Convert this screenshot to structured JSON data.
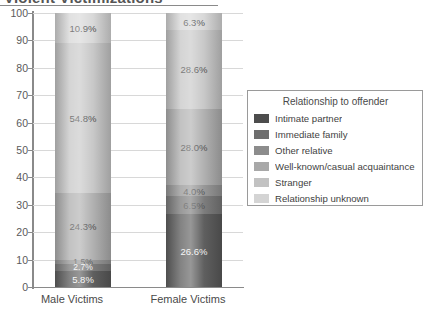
{
  "chart": {
    "title": "Violent Victimizations",
    "xlabel": "",
    "ylabel": ""
  },
  "axis": {
    "ticks": [
      "100",
      "90",
      "80",
      "70",
      "60",
      "50",
      "40",
      "30",
      "20",
      "10",
      "0"
    ]
  },
  "categories": {
    "male": "Male Victims",
    "female": "Female Victims"
  },
  "legend": {
    "title": "Relationship to offender",
    "items": [
      {
        "label": "Intimate partner",
        "color": "#4d4d4d"
      },
      {
        "label": "Immediate family",
        "color": "#6e6e6e"
      },
      {
        "label": "Other relative",
        "color": "#8c8c8c"
      },
      {
        "label": "Well-known/casual acquaintance",
        "color": "#a8a8a8"
      },
      {
        "label": "Stranger",
        "color": "#c2c2c2"
      },
      {
        "label": "Relationship unknown",
        "color": "#d4d4d4"
      }
    ]
  },
  "segments": {
    "male": [
      {
        "label": "10.9%",
        "value": 10.9,
        "series": "Relationship unknown",
        "color": "#d4d4d4",
        "light": false
      },
      {
        "label": "54.8%",
        "value": 54.8,
        "series": "Stranger",
        "color": "#c2c2c2",
        "light": false
      },
      {
        "label": "24.3%",
        "value": 24.3,
        "series": "Well-known/casual acquaintance",
        "color": "#a8a8a8",
        "light": false
      },
      {
        "label": "1.5%",
        "value": 1.5,
        "series": "Other relative",
        "color": "#8c8c8c",
        "light": false
      },
      {
        "label": "2.7%",
        "value": 2.7,
        "series": "Immediate family",
        "color": "#6e6e6e",
        "light": true
      },
      {
        "label": "5.8%",
        "value": 5.8,
        "series": "Intimate partner",
        "color": "#4d4d4d",
        "light": true
      }
    ],
    "female": [
      {
        "label": "6.3%",
        "value": 6.3,
        "series": "Relationship unknown",
        "color": "#d4d4d4",
        "light": false
      },
      {
        "label": "28.6%",
        "value": 28.6,
        "series": "Stranger",
        "color": "#c2c2c2",
        "light": false
      },
      {
        "label": "28.0%",
        "value": 28.0,
        "series": "Well-known/casual acquaintance",
        "color": "#a8a8a8",
        "light": false
      },
      {
        "label": "4.0%",
        "value": 4.0,
        "series": "Other relative",
        "color": "#8c8c8c",
        "light": false
      },
      {
        "label": "6.5%",
        "value": 6.5,
        "series": "Immediate family",
        "color": "#6e6e6e",
        "light": false
      },
      {
        "label": "26.6%",
        "value": 26.6,
        "series": "Intimate partner",
        "color": "#4d4d4d",
        "light": true
      }
    ]
  },
  "chart_data": {
    "type": "bar",
    "title": "Violent Victimizations",
    "subtitle": "",
    "xlabel": "",
    "ylabel": "",
    "ylim": [
      0,
      100
    ],
    "yticks": [
      0,
      10,
      20,
      30,
      40,
      50,
      60,
      70,
      80,
      90,
      100
    ],
    "grid": true,
    "stacked": true,
    "normalized_percent": true,
    "legend_title": "Relationship to offender",
    "legend_position": "right",
    "categories": [
      "Male Victims",
      "Female Victims"
    ],
    "series": [
      {
        "name": "Intimate partner",
        "values": [
          5.8,
          26.6
        ],
        "color": "#4d4d4d"
      },
      {
        "name": "Immediate family",
        "values": [
          2.7,
          6.5
        ],
        "color": "#6e6e6e"
      },
      {
        "name": "Other relative",
        "values": [
          1.5,
          4.0
        ],
        "color": "#8c8c8c"
      },
      {
        "name": "Well-known/casual acquaintance",
        "values": [
          24.3,
          28.0
        ],
        "color": "#a8a8a8"
      },
      {
        "name": "Stranger",
        "values": [
          54.8,
          28.6
        ],
        "color": "#c2c2c2"
      },
      {
        "name": "Relationship unknown",
        "values": [
          10.9,
          6.3
        ],
        "color": "#d4d4d4"
      }
    ],
    "data_labels": {
      "Male Victims": [
        "5.8%",
        "2.7%",
        "1.5%",
        "24.3%",
        "54.8%",
        "10.9%"
      ],
      "Female Victims": [
        "26.6%",
        "6.5%",
        "4.0%",
        "28.0%",
        "28.6%",
        "6.3%"
      ]
    },
    "totals": {
      "Male Victims": 100.0,
      "Female Victims": 100.0
    }
  }
}
